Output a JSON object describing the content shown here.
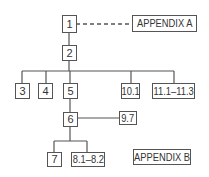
{
  "diagram": {
    "type": "hierarchy",
    "nodes": [
      {
        "id": "n1",
        "label": "1"
      },
      {
        "id": "appA",
        "label": "APPENDIX A"
      },
      {
        "id": "n2",
        "label": "2"
      },
      {
        "id": "n3",
        "label": "3"
      },
      {
        "id": "n4",
        "label": "4"
      },
      {
        "id": "n5",
        "label": "5"
      },
      {
        "id": "n10_1",
        "label": "10.1"
      },
      {
        "id": "n11",
        "label": "11.1–11.3"
      },
      {
        "id": "n6",
        "label": "6"
      },
      {
        "id": "n9_7",
        "label": "9.7"
      },
      {
        "id": "n7",
        "label": "7"
      },
      {
        "id": "n8",
        "label": "8.1–8.2"
      },
      {
        "id": "appB",
        "label": "APPENDIX B"
      }
    ],
    "edges": [
      {
        "from": "n1",
        "to": "appA",
        "style": "dashed"
      },
      {
        "from": "n1",
        "to": "n2",
        "style": "solid"
      },
      {
        "from": "n2",
        "to": "n3",
        "style": "solid"
      },
      {
        "from": "n2",
        "to": "n4",
        "style": "solid"
      },
      {
        "from": "n2",
        "to": "n5",
        "style": "solid"
      },
      {
        "from": "n2",
        "to": "n10_1",
        "style": "solid"
      },
      {
        "from": "n2",
        "to": "n11",
        "style": "solid"
      },
      {
        "from": "n5",
        "to": "n6",
        "style": "solid"
      },
      {
        "from": "n6",
        "to": "n9_7",
        "style": "solid"
      },
      {
        "from": "n6",
        "to": "n7",
        "style": "solid"
      },
      {
        "from": "n6",
        "to": "n8",
        "style": "solid"
      }
    ],
    "colors": {
      "line": "#555555",
      "text": "#333333",
      "background": "#ffffff"
    }
  }
}
